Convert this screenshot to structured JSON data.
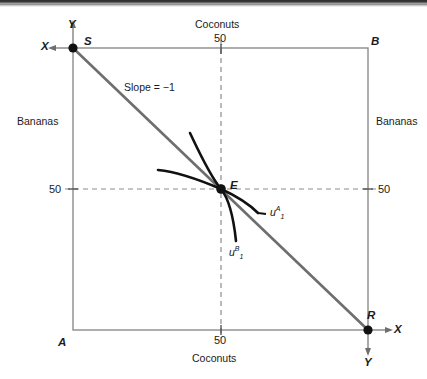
{
  "figure": {
    "type": "edgeworth-box-diagram",
    "title_visible": false,
    "box": {
      "left": 73,
      "top": 48,
      "right": 368,
      "bottom": 330
    },
    "corners": [
      {
        "name": "S",
        "label": "S",
        "x": 73,
        "y": 48,
        "dot": true
      },
      {
        "name": "B",
        "label": "B",
        "x": 368,
        "y": 48,
        "dot": false
      },
      {
        "name": "A",
        "label": "A",
        "x": 73,
        "y": 330,
        "dot": false
      },
      {
        "name": "R",
        "label": "R",
        "x": 368,
        "y": 330,
        "dot": true
      }
    ],
    "equilibrium": {
      "label": "E",
      "x": 221,
      "y": 189,
      "dot": true
    },
    "axis_labels": {
      "top_commodity": "Coconuts",
      "bottom_commodity": "Coconuts",
      "left_commodity": "Bananas",
      "right_commodity": "Bananas",
      "top_left_y": "Y",
      "top_left_x": "X",
      "bottom_right_x": "X",
      "bottom_right_y": "Y"
    },
    "ticks": {
      "top": "50",
      "bottom": "50",
      "left": "50",
      "right": "50"
    },
    "budget_line": {
      "annotation": "Slope = −1",
      "from": "S",
      "to": "R",
      "color": "#6e6e6e"
    },
    "curves": [
      {
        "name": "indifference-curve-a",
        "label_u": "u",
        "label_sub": "1",
        "label_sup": "A",
        "color": "#111111"
      },
      {
        "name": "indifference-curve-b",
        "label_u": "u",
        "label_sub": "1",
        "label_sup": "B",
        "color": "#111111"
      }
    ],
    "colors": {
      "box_border": "#8c8c8c",
      "dashed": "#8c8c8c",
      "budget": "#6e6e6e",
      "curve": "#111111",
      "text": "#1b1b1b",
      "background": "#ffffff"
    }
  }
}
